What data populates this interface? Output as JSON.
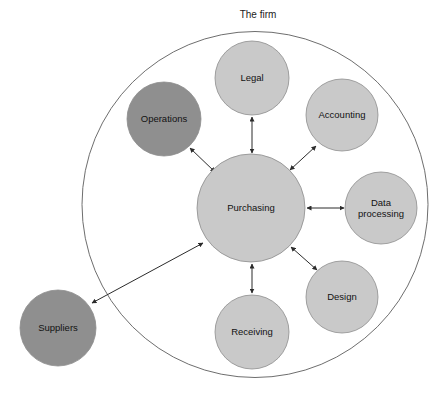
{
  "diagram": {
    "title": "The firm",
    "boundary": {
      "label": "The firm",
      "label_x": 258,
      "label_y": 18,
      "cx": 255,
      "cy": 204.5,
      "r": 173,
      "stroke": "#6e6e6e"
    },
    "colors": {
      "internal_node_fill": "#c9c9c9",
      "external_node_fill": "#8f8f8f",
      "node_stroke": "#8d8d8d",
      "connector": "#2b2b2b",
      "label_text": "#121212",
      "background": "#ffffff"
    },
    "nodes": [
      {
        "id": "purchasing",
        "label": "Purchasing",
        "lines": [
          "Purchasing"
        ],
        "cx": 251,
        "cy": 208,
        "r": 54,
        "fill": "#c9c9c9",
        "scope": "internal"
      },
      {
        "id": "legal",
        "label": "Legal",
        "lines": [
          "Legal"
        ],
        "cx": 252,
        "cy": 78,
        "r": 37,
        "fill": "#c9c9c9",
        "scope": "internal"
      },
      {
        "id": "operations",
        "label": "Operations",
        "lines": [
          "Operations"
        ],
        "cx": 164,
        "cy": 119,
        "r": 37,
        "fill": "#8f8f8f",
        "scope": "internal"
      },
      {
        "id": "accounting",
        "label": "Accounting",
        "lines": [
          "Accounting"
        ],
        "cx": 342,
        "cy": 115,
        "r": 36,
        "fill": "#c9c9c9",
        "scope": "internal"
      },
      {
        "id": "data-processing",
        "label": "Data processing",
        "lines": [
          "Data",
          "processing"
        ],
        "cx": 381,
        "cy": 208,
        "r": 36,
        "fill": "#c9c9c9",
        "scope": "internal"
      },
      {
        "id": "design",
        "label": "Design",
        "lines": [
          "Design"
        ],
        "cx": 342,
        "cy": 297,
        "r": 36,
        "fill": "#c9c9c9",
        "scope": "internal"
      },
      {
        "id": "receiving",
        "label": "Receiving",
        "lines": [
          "Receiving"
        ],
        "cx": 252,
        "cy": 332,
        "r": 37,
        "fill": "#c9c9c9",
        "scope": "internal"
      },
      {
        "id": "suppliers",
        "label": "Suppliers",
        "lines": [
          "Suppliers"
        ],
        "cx": 58,
        "cy": 328,
        "r": 38,
        "fill": "#8f8f8f",
        "scope": "external"
      }
    ],
    "connectors": [
      {
        "id": "purchasing-legal",
        "from": "purchasing",
        "to": "legal",
        "x1": 252,
        "y1": 153,
        "x2": 252,
        "y2": 117,
        "double": true
      },
      {
        "id": "purchasing-operations",
        "from": "purchasing",
        "to": "operations",
        "x1": 215,
        "y1": 172,
        "x2": 190,
        "y2": 148,
        "double": true
      },
      {
        "id": "purchasing-accounting",
        "from": "purchasing",
        "to": "accounting",
        "x1": 290,
        "y1": 170,
        "x2": 316,
        "y2": 146,
        "double": true
      },
      {
        "id": "purchasing-data-processing",
        "from": "purchasing",
        "to": "data-processing",
        "x1": 307,
        "y1": 208,
        "x2": 344,
        "y2": 208,
        "double": true
      },
      {
        "id": "purchasing-design",
        "from": "purchasing",
        "to": "design",
        "x1": 291,
        "y1": 247,
        "x2": 317,
        "y2": 270,
        "double": true
      },
      {
        "id": "purchasing-receiving",
        "from": "purchasing",
        "to": "receiving",
        "x1": 252,
        "y1": 264,
        "x2": 252,
        "y2": 293,
        "double": true
      },
      {
        "id": "purchasing-suppliers",
        "from": "purchasing",
        "to": "suppliers",
        "x1": 203,
        "y1": 243,
        "x2": 92,
        "y2": 303,
        "double": true
      }
    ]
  }
}
